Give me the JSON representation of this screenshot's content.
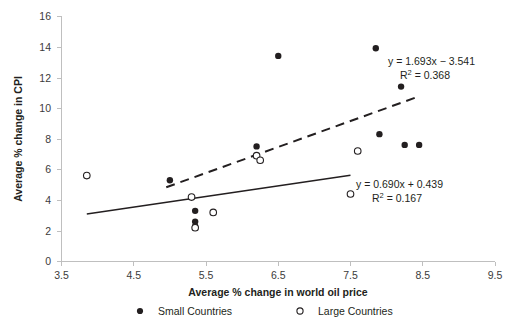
{
  "chart_data": {
    "type": "scatter",
    "title": "",
    "xlabel": "Average % change in world oil price",
    "ylabel": "Average % change in CPI",
    "xlim": [
      3.5,
      9.5
    ],
    "ylim": [
      0,
      16
    ],
    "xticks": [
      "3.5",
      "4.5",
      "5.5",
      "6.5",
      "7.5",
      "8.5",
      "9.5"
    ],
    "yticks": [
      "0",
      "2",
      "4",
      "6",
      "8",
      "10",
      "12",
      "14",
      "16"
    ],
    "xtick_step": 1.0,
    "ytick_step": 2,
    "grid": false,
    "legend_position": "bottom",
    "series": [
      {
        "name": "Small Countries",
        "marker": "filled-circle",
        "color": "#231f20",
        "points": [
          {
            "x": 5.0,
            "y": 5.3
          },
          {
            "x": 5.35,
            "y": 3.3
          },
          {
            "x": 5.35,
            "y": 2.6
          },
          {
            "x": 5.35,
            "y": 2.3
          },
          {
            "x": 6.2,
            "y": 7.5
          },
          {
            "x": 6.5,
            "y": 13.4
          },
          {
            "x": 7.85,
            "y": 13.9
          },
          {
            "x": 7.9,
            "y": 8.3
          },
          {
            "x": 8.2,
            "y": 11.4
          },
          {
            "x": 8.25,
            "y": 7.6
          },
          {
            "x": 8.45,
            "y": 7.6
          }
        ]
      },
      {
        "name": "Large Countries",
        "marker": "open-circle",
        "color": "#231f20",
        "points": [
          {
            "x": 3.85,
            "y": 5.6
          },
          {
            "x": 5.3,
            "y": 4.2
          },
          {
            "x": 5.35,
            "y": 2.2
          },
          {
            "x": 5.6,
            "y": 3.2
          },
          {
            "x": 6.2,
            "y": 6.9
          },
          {
            "x": 6.25,
            "y": 6.6
          },
          {
            "x": 7.6,
            "y": 7.2
          },
          {
            "x": 7.5,
            "y": 4.4
          }
        ]
      }
    ],
    "trendlines": [
      {
        "name": "small-countries-trendline",
        "style": "dashed",
        "slope": 1.693,
        "intercept": -3.541,
        "r_squared": 0.368,
        "equation": "y = 1.693x − 3.541",
        "r2_label": "R² = 0.368",
        "x_start": 4.95,
        "x_end": 8.45
      },
      {
        "name": "large-countries-trendline",
        "style": "solid",
        "slope": 0.69,
        "intercept": 0.439,
        "r_squared": 0.167,
        "equation": "y = 0.690x + 0.439",
        "r2_label": "R² = 0.167",
        "x_start": 3.85,
        "x_end": 7.5
      }
    ],
    "annotations": [
      {
        "name": "dashed-equation-annotation",
        "line1": "y = 1.693x − 3.541",
        "line2_pre": "R",
        "line2_sup": "2",
        "line2_post": " = 0.368"
      },
      {
        "name": "solid-equation-annotation",
        "line1": "y = 0.690x + 0.439",
        "line2_pre": "R",
        "line2_sup": "2",
        "line2_post": " = 0.167"
      }
    ],
    "legend": [
      {
        "label": "Small Countries",
        "marker": "filled-circle"
      },
      {
        "label": "Large Countries",
        "marker": "open-circle"
      }
    ]
  }
}
